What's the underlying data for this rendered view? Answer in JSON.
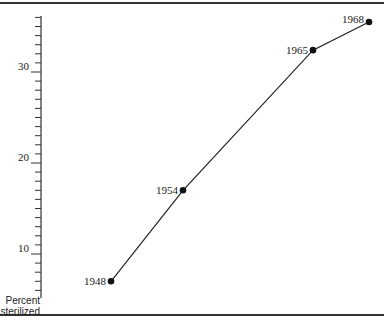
{
  "chart_data": {
    "type": "line",
    "title": "",
    "xlabel": "",
    "ylabel": "Percent sterilized",
    "x": [
      "1948",
      "1954",
      "1965",
      "1968"
    ],
    "series": [
      {
        "name": "Percent sterilized",
        "values": [
          7,
          17,
          32.4,
          35.5
        ]
      }
    ],
    "yticks": [
      10,
      20,
      30
    ],
    "ylim": [
      4,
      36
    ],
    "grid": false,
    "legend": "none",
    "point_labels": [
      "1948",
      "1954",
      "1965",
      "1968"
    ]
  },
  "axis": {
    "ylabel_line1": "Percent",
    "ylabel_line2": "sterilized",
    "tick_labels": [
      "10",
      "20",
      "30"
    ]
  }
}
